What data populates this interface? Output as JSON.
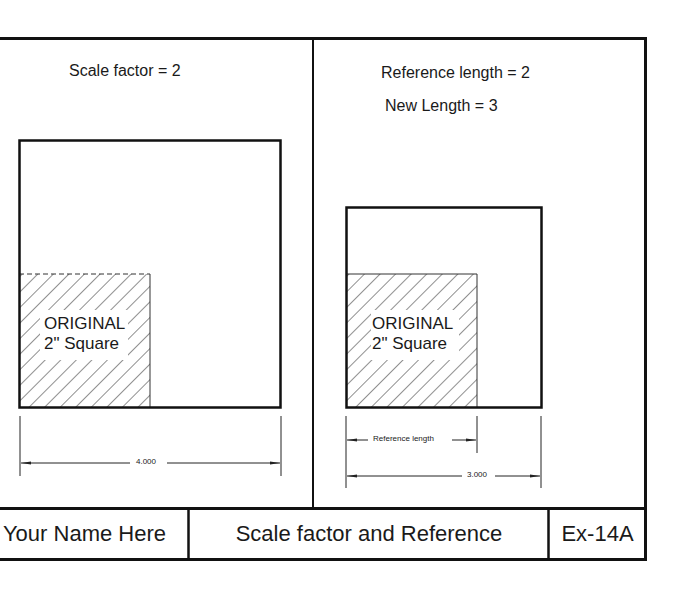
{
  "left_panel": {
    "heading": "Scale factor = 2",
    "shape_label_line1": "ORIGINAL",
    "shape_label_line2": "2\" Square",
    "dimension": "4.000"
  },
  "right_panel": {
    "heading_line1": "Reference length = 2",
    "heading_line2": "New Length = 3",
    "shape_label_line1": "ORIGINAL",
    "shape_label_line2": "2\" Square",
    "reference_dimension_label": "Reference length",
    "dimension": "3.000"
  },
  "title_block": {
    "name": "Your Name Here",
    "title": "Scale factor and Reference",
    "exercise": "Ex-14A"
  },
  "colors": {
    "line": "#111111",
    "background": "#ffffff"
  }
}
